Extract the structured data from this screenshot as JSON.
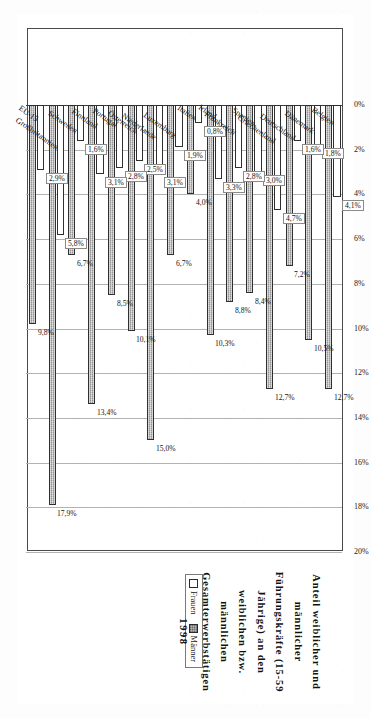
{
  "title": {
    "line1": "Anteil weiblicher und männlicher Führungskräfte (15-59 Jährige) an den",
    "line2": "weiblichen bzw. männlichen Gesamterwerbstätigen",
    "year": "1998"
  },
  "legend": {
    "position": "left",
    "items": [
      {
        "label": "Frauen",
        "color": "#ffffff"
      },
      {
        "label": "Männer",
        "color": "#b4b4b4"
      }
    ]
  },
  "chart_data": {
    "type": "bar",
    "orientation": "horizontal",
    "title": "Anteil weiblicher und männlicher Führungskräfte (15-59 Jährige) an den weiblichen bzw. männlichen Gesamterwerbstätigen 1998",
    "xlabel": "",
    "ylabel": "",
    "xlim": [
      0,
      20
    ],
    "grid": true,
    "legend_position": "left",
    "value_suffix": "%",
    "tick_labels": [
      "0%",
      "2%",
      "4%",
      "6%",
      "8%",
      "10%",
      "12%",
      "14%",
      "16%",
      "18%",
      "20%"
    ],
    "ticks": [
      0,
      2,
      4,
      6,
      8,
      10,
      12,
      14,
      16,
      18,
      20
    ],
    "categories": [
      "Belgien",
      "Dänemark",
      "Deutschland",
      "Griechenland",
      "Spanien",
      "Frankreich",
      "Irland",
      "Italien",
      "Luxemburg",
      "Niederlande",
      "Österreich",
      "Portugal",
      "Finnland",
      "Schweden",
      "Großbritannien",
      "EU-15"
    ],
    "series": [
      {
        "name": "Frauen",
        "values": [
          4.1,
          1.8,
          1.6,
          4.7,
          3.0,
          2.8,
          3.3,
          0.8,
          1.9,
          3.1,
          2.5,
          2.8,
          3.1,
          1.6,
          5.8,
          2.9
        ],
        "labels": [
          "4,1%",
          "1,8%",
          "1,6%",
          "4,7%",
          "3,0%",
          "2,8%",
          "3,3%",
          "0,8%",
          "1,9%",
          "3,1%",
          "2,5%",
          "2,8%",
          "3,1%",
          "1,6%",
          "5,8%",
          "2,9%"
        ]
      },
      {
        "name": "Männer",
        "values": [
          12.7,
          10.5,
          7.2,
          12.7,
          8.4,
          8.8,
          10.3,
          4.0,
          6.7,
          15.0,
          10.1,
          8.5,
          13.4,
          6.7,
          17.9,
          9.8
        ],
        "labels": [
          "12,7%",
          "10,5%",
          "7,2%",
          "12,7%",
          "8,4%",
          "8,8%",
          "10,3%",
          "4,0%",
          "6,7%",
          "15,0%",
          "10,1%",
          "8,5%",
          "13,4%",
          "6,7%",
          "17,9%",
          "9,8%"
        ]
      }
    ]
  }
}
